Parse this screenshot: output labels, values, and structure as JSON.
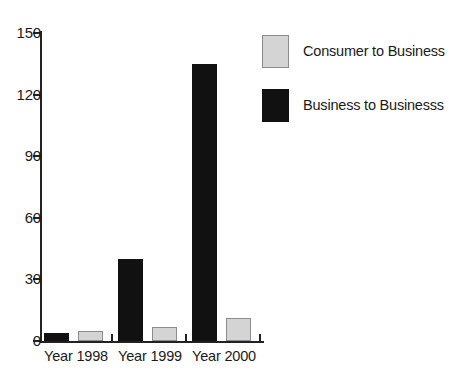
{
  "chart_data": {
    "type": "bar",
    "title": "",
    "xlabel": "",
    "ylabel": "",
    "categories": [
      "Year 1998",
      "Year 1999",
      "Year 2000"
    ],
    "series": [
      {
        "name": "Consumer to Business",
        "color": "#d4d4d4",
        "values": [
          5,
          7,
          11
        ]
      },
      {
        "name": "Business to Businesss",
        "color": "#111111",
        "values": [
          4,
          40,
          135
        ]
      }
    ],
    "yticks": [
      0,
      30,
      60,
      90,
      120,
      150
    ],
    "ylim": [
      0,
      150
    ],
    "grid": false,
    "legend_position": "right"
  },
  "legend": {
    "items": [
      {
        "label": "Consumer to Business",
        "swatch": "light-grey"
      },
      {
        "label": "Business to Businesss",
        "swatch": "black"
      }
    ]
  }
}
